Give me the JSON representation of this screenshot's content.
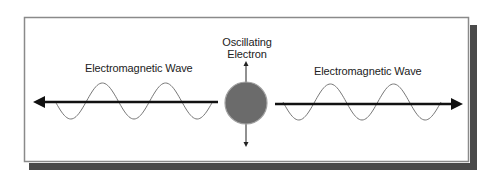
{
  "diagram": {
    "center_label_line1": "Oscillating",
    "center_label_line2": "Electron",
    "left_wave_label": "Electromagnetic Wave",
    "right_wave_label": "Electromagnetic Wave",
    "colors": {
      "frame_border": "#8a8a8a",
      "shadow": "#4a4a4a",
      "electron_fill": "#6b6b6b",
      "electron_edge": "#9a9a9a",
      "arrow": "#111111",
      "wave": "#777777"
    },
    "elements": {
      "electron": {
        "cx": 246,
        "cy": 103,
        "r": 21
      },
      "left_arrow": {
        "from_x": 218,
        "to_x": 33,
        "y": 102
      },
      "right_arrow": {
        "from_x": 275,
        "to_x": 463,
        "y": 104
      },
      "oscillation_arrow": {
        "x": 246,
        "top_y": 62,
        "bottom_y": 146
      },
      "left_wave": {
        "start_x": 55,
        "end_x": 213,
        "axis_y": 101,
        "amplitude": 18,
        "half_periods": 5,
        "start_phase": "down"
      },
      "right_wave": {
        "start_x": 283,
        "end_x": 441,
        "axis_y": 102,
        "amplitude": 18,
        "half_periods": 5,
        "start_phase": "down"
      }
    }
  }
}
